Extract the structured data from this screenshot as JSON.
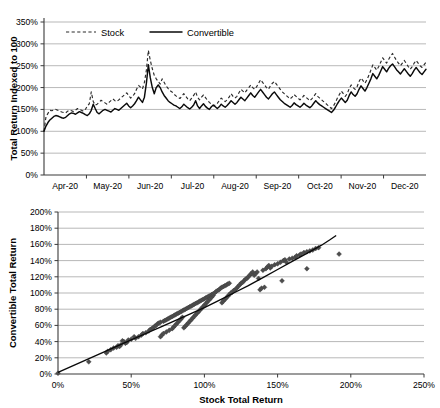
{
  "figure": {
    "background_color": "#ffffff",
    "ink_color": "#000000",
    "grid_color": "#9a9a9a"
  },
  "chart_data": [
    {
      "id": "indexed-total-return-timeseries",
      "type": "line",
      "title": "",
      "xlabel": "",
      "ylabel": "Total Return Indexed to 100",
      "xlim": [
        0,
        9
      ],
      "ylim": [
        0,
        350
      ],
      "ytick_labels": [
        "0%",
        "50%",
        "100%",
        "150%",
        "200%",
        "250%",
        "300%",
        "350%"
      ],
      "ytick_values": [
        0,
        50,
        100,
        150,
        200,
        250,
        300,
        350
      ],
      "xtick_labels": [
        "Apr-20",
        "May-20",
        "Jun-20",
        "Jul-20",
        "Aug-20",
        "Sep-20",
        "Oct-20",
        "Nov-20",
        "Dec-20"
      ],
      "grid": true,
      "legend_position": "top-left-inside",
      "legend": [
        {
          "name": "Stock",
          "style": "dashed"
        },
        {
          "name": "Convertible",
          "style": "solid"
        }
      ],
      "series": [
        {
          "name": "Stock",
          "style": "dashed",
          "values": [
            100,
            133,
            141,
            148,
            147,
            149,
            150,
            148,
            146,
            144,
            143,
            142,
            146,
            148,
            147,
            145,
            148,
            152,
            150,
            148,
            146,
            150,
            158,
            163,
            190,
            168,
            160,
            162,
            166,
            171,
            168,
            165,
            162,
            166,
            170,
            174,
            170,
            168,
            172,
            176,
            180,
            184,
            188,
            182,
            176,
            180,
            186,
            196,
            205,
            201,
            197,
            212,
            240,
            285,
            262,
            243,
            228,
            220,
            214,
            208,
            220,
            212,
            204,
            198,
            193,
            190,
            185,
            181,
            178,
            175,
            180,
            186,
            180,
            174,
            170,
            176,
            182,
            190,
            178,
            172,
            178,
            183,
            177,
            171,
            166,
            162,
            158,
            160,
            164,
            170,
            176,
            172,
            168,
            172,
            178,
            186,
            180,
            176,
            180,
            188,
            196,
            192,
            188,
            194,
            200,
            206,
            200,
            196,
            202,
            210,
            218,
            212,
            206,
            200,
            196,
            204,
            210,
            214,
            208,
            202,
            196,
            190,
            186,
            182,
            178,
            174,
            178,
            184,
            180,
            176,
            172,
            176,
            182,
            178,
            174,
            170,
            174,
            180,
            186,
            180,
            176,
            172,
            168,
            164,
            160,
            156,
            152,
            158,
            166,
            176,
            184,
            192,
            186,
            180,
            186,
            198,
            206,
            200,
            196,
            202,
            214,
            222,
            216,
            210,
            218,
            228,
            240,
            252,
            246,
            240,
            248,
            258,
            268,
            262,
            256,
            264,
            272,
            278,
            270,
            262,
            256,
            250,
            256,
            262,
            255,
            248,
            242,
            248,
            256,
            262,
            256,
            250,
            246,
            252,
            258
          ]
        },
        {
          "name": "Convertible",
          "style": "solid",
          "values": [
            100,
            112,
            120,
            126,
            130,
            134,
            136,
            135,
            133,
            131,
            130,
            132,
            136,
            140,
            142,
            141,
            139,
            142,
            145,
            143,
            141,
            138,
            136,
            140,
            148,
            162,
            152,
            143,
            140,
            144,
            148,
            150,
            148,
            146,
            144,
            148,
            152,
            150,
            148,
            152,
            156,
            160,
            164,
            158,
            154,
            158,
            163,
            170,
            178,
            172,
            166,
            178,
            210,
            252,
            222,
            200,
            186,
            200,
            206,
            200,
            190,
            182,
            176,
            170,
            166,
            163,
            160,
            158,
            155,
            152,
            156,
            162,
            158,
            154,
            151,
            155,
            160,
            170,
            158,
            152,
            158,
            163,
            157,
            153,
            150,
            156,
            160,
            156,
            152,
            156,
            162,
            158,
            155,
            159,
            164,
            170,
            166,
            162,
            166,
            172,
            178,
            174,
            170,
            176,
            182,
            188,
            182,
            178,
            184,
            190,
            196,
            190,
            184,
            178,
            174,
            180,
            186,
            190,
            184,
            178,
            172,
            168,
            164,
            161,
            158,
            155,
            159,
            165,
            161,
            158,
            155,
            159,
            164,
            160,
            157,
            154,
            158,
            164,
            170,
            165,
            161,
            158,
            155,
            152,
            149,
            146,
            143,
            148,
            155,
            163,
            170,
            176,
            171,
            166,
            171,
            182,
            190,
            184,
            180,
            186,
            196,
            204,
            198,
            192,
            200,
            210,
            220,
            232,
            226,
            220,
            228,
            238,
            248,
            242,
            236,
            244,
            250,
            254,
            248,
            241,
            236,
            231,
            237,
            243,
            237,
            231,
            226,
            232,
            240,
            246,
            240,
            234,
            230,
            236,
            242
          ]
        }
      ]
    },
    {
      "id": "convertible-vs-stock-scatter",
      "type": "scatter",
      "title": "",
      "xlabel": "Stock Total Return",
      "ylabel": "Convertible Total Return",
      "xlim": [
        0,
        250
      ],
      "ylim": [
        0,
        200
      ],
      "xtick_labels": [
        "0%",
        "50%",
        "100%",
        "150%",
        "200%",
        "250%"
      ],
      "xtick_values": [
        0,
        50,
        100,
        150,
        200,
        250
      ],
      "ytick_labels": [
        "0%",
        "20%",
        "40%",
        "60%",
        "80%",
        "100%",
        "120%",
        "140%",
        "160%",
        "180%",
        "200%"
      ],
      "ytick_values": [
        0,
        20,
        40,
        60,
        80,
        100,
        120,
        140,
        160,
        180,
        200
      ],
      "grid": true,
      "legend_position": "none",
      "marker": "diamond",
      "points": [
        [
          0,
          1
        ],
        [
          21,
          15
        ],
        [
          33,
          26
        ],
        [
          34,
          28
        ],
        [
          36,
          30
        ],
        [
          38,
          32
        ],
        [
          40,
          33
        ],
        [
          41,
          35
        ],
        [
          42,
          34
        ],
        [
          43,
          36
        ],
        [
          44,
          41
        ],
        [
          45,
          40
        ],
        [
          46,
          38
        ],
        [
          47,
          39
        ],
        [
          48,
          42
        ],
        [
          50,
          43
        ],
        [
          52,
          46
        ],
        [
          53,
          44
        ],
        [
          55,
          46
        ],
        [
          57,
          48
        ],
        [
          58,
          50
        ],
        [
          60,
          51
        ],
        [
          62,
          53
        ],
        [
          63,
          55
        ],
        [
          64,
          56
        ],
        [
          65,
          57
        ],
        [
          66,
          59
        ],
        [
          67,
          60
        ],
        [
          68,
          62
        ],
        [
          69,
          63
        ],
        [
          70,
          64
        ],
        [
          70,
          46
        ],
        [
          71,
          48
        ],
        [
          72,
          50
        ],
        [
          72,
          65
        ],
        [
          73,
          66
        ],
        [
          74,
          52
        ],
        [
          74,
          67
        ],
        [
          75,
          68
        ],
        [
          76,
          54
        ],
        [
          76,
          69
        ],
        [
          77,
          70
        ],
        [
          78,
          56
        ],
        [
          78,
          71
        ],
        [
          79,
          58
        ],
        [
          79,
          72
        ],
        [
          80,
          60
        ],
        [
          80,
          73
        ],
        [
          81,
          62
        ],
        [
          81,
          74
        ],
        [
          82,
          64
        ],
        [
          82,
          75
        ],
        [
          83,
          66
        ],
        [
          83,
          76
        ],
        [
          84,
          68
        ],
        [
          84,
          77
        ],
        [
          85,
          70
        ],
        [
          85,
          78
        ],
        [
          86,
          57
        ],
        [
          86,
          79
        ],
        [
          87,
          59
        ],
        [
          87,
          80
        ],
        [
          88,
          61
        ],
        [
          88,
          81
        ],
        [
          89,
          63
        ],
        [
          89,
          82
        ],
        [
          90,
          65
        ],
        [
          90,
          83
        ],
        [
          91,
          67
        ],
        [
          91,
          84
        ],
        [
          92,
          69
        ],
        [
          92,
          85
        ],
        [
          93,
          71
        ],
        [
          93,
          86
        ],
        [
          94,
          73
        ],
        [
          94,
          87
        ],
        [
          95,
          75
        ],
        [
          95,
          88
        ],
        [
          96,
          77
        ],
        [
          96,
          89
        ],
        [
          97,
          79
        ],
        [
          97,
          90
        ],
        [
          98,
          81
        ],
        [
          98,
          91
        ],
        [
          99,
          83
        ],
        [
          99,
          92
        ],
        [
          100,
          85
        ],
        [
          100,
          93
        ],
        [
          101,
          87
        ],
        [
          101,
          94
        ],
        [
          102,
          89
        ],
        [
          102,
          95
        ],
        [
          103,
          91
        ],
        [
          103,
          96
        ],
        [
          104,
          93
        ],
        [
          104,
          97
        ],
        [
          105,
          95
        ],
        [
          105,
          98
        ],
        [
          106,
          97
        ],
        [
          106,
          99
        ],
        [
          107,
          100
        ],
        [
          108,
          102
        ],
        [
          109,
          103
        ],
        [
          110,
          104
        ],
        [
          111,
          106
        ],
        [
          112,
          88
        ],
        [
          112,
          107
        ],
        [
          113,
          90
        ],
        [
          113,
          108
        ],
        [
          114,
          92
        ],
        [
          114,
          109
        ],
        [
          115,
          94
        ],
        [
          115,
          110
        ],
        [
          116,
          96
        ],
        [
          116,
          111
        ],
        [
          117,
          98
        ],
        [
          117,
          112
        ],
        [
          118,
          100
        ],
        [
          119,
          101
        ],
        [
          120,
          103
        ],
        [
          121,
          104
        ],
        [
          122,
          106
        ],
        [
          123,
          108
        ],
        [
          124,
          110
        ],
        [
          125,
          112
        ],
        [
          126,
          113
        ],
        [
          127,
          115
        ],
        [
          128,
          117
        ],
        [
          129,
          118
        ],
        [
          130,
          120
        ],
        [
          131,
          122
        ],
        [
          132,
          124
        ],
        [
          133,
          126
        ],
        [
          134,
          122
        ],
        [
          135,
          124
        ],
        [
          136,
          126
        ],
        [
          137,
          118
        ],
        [
          138,
          104
        ],
        [
          139,
          106
        ],
        [
          140,
          128
        ],
        [
          141,
          107
        ],
        [
          142,
          130
        ],
        [
          143,
          132
        ],
        [
          144,
          134
        ],
        [
          145,
          131
        ],
        [
          146,
          133
        ],
        [
          148,
          135
        ],
        [
          150,
          136
        ],
        [
          152,
          138
        ],
        [
          153,
          115
        ],
        [
          154,
          140
        ],
        [
          155,
          141
        ],
        [
          156,
          138
        ],
        [
          158,
          142
        ],
        [
          160,
          143
        ],
        [
          162,
          144
        ],
        [
          163,
          146
        ],
        [
          165,
          147
        ],
        [
          166,
          148
        ],
        [
          168,
          150
        ],
        [
          170,
          130
        ],
        [
          170,
          151
        ],
        [
          172,
          152
        ],
        [
          174,
          153
        ],
        [
          176,
          155
        ],
        [
          178,
          156
        ],
        [
          192,
          148
        ]
      ],
      "trend": {
        "label": "fitted curve",
        "type": "power",
        "points": [
          [
            0,
            2
          ],
          [
            10,
            10
          ],
          [
            20,
            18
          ],
          [
            30,
            26
          ],
          [
            40,
            34
          ],
          [
            50,
            42
          ],
          [
            60,
            50
          ],
          [
            70,
            58
          ],
          [
            80,
            66
          ],
          [
            90,
            74
          ],
          [
            100,
            82
          ],
          [
            110,
            91
          ],
          [
            120,
            100
          ],
          [
            130,
            109
          ],
          [
            140,
            119
          ],
          [
            150,
            129
          ],
          [
            160,
            139
          ],
          [
            170,
            149
          ],
          [
            180,
            159
          ],
          [
            186,
            166
          ],
          [
            190,
            171
          ]
        ]
      }
    }
  ]
}
